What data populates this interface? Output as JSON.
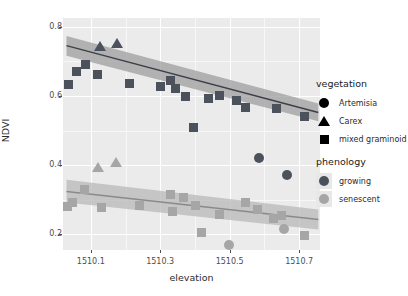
{
  "chart_data": {
    "type": "scatter",
    "title": "",
    "xlabel": "elevation",
    "ylabel": "NDVI",
    "xlim": [
      1510.02,
      1510.76
    ],
    "ylim": [
      0.155,
      0.825
    ],
    "xticks": [
      1510.1,
      1510.3,
      1510.5,
      1510.7
    ],
    "xticklabels": [
      "1510.1",
      "1510.3",
      "1510.5",
      "1510.7"
    ],
    "yticks": [
      0.2,
      0.4,
      0.6,
      0.8
    ],
    "yticklabels": [
      "0.2",
      "0.4",
      "0.6",
      "0.8"
    ],
    "grid": true,
    "panel_background": "#ebebeb",
    "legend_position": "right",
    "shape_variable": "vegetation",
    "color_variable": "phenology",
    "series": [
      {
        "name": "growing",
        "color": "#4c525c",
        "ribbon_color": "#9a9a9a",
        "fit_line": {
          "x0": 1510.03,
          "y0": 0.745,
          "x1": 1510.755,
          "y1": 0.552
        },
        "ribbon": {
          "x0": 1510.03,
          "upper0": 0.773,
          "lower0": 0.716,
          "x1": 1510.755,
          "upper1": 0.578,
          "lower1": 0.527
        },
        "points": [
          {
            "x": 1510.035,
            "y": 0.632,
            "vegetation": "mixed graminoid"
          },
          {
            "x": 1510.06,
            "y": 0.672,
            "vegetation": "mixed graminoid"
          },
          {
            "x": 1510.085,
            "y": 0.69,
            "vegetation": "mixed graminoid"
          },
          {
            "x": 1510.118,
            "y": 0.663,
            "vegetation": "mixed graminoid"
          },
          {
            "x": 1510.125,
            "y": 0.745,
            "vegetation": "Carex"
          },
          {
            "x": 1510.175,
            "y": 0.752,
            "vegetation": "Carex"
          },
          {
            "x": 1510.212,
            "y": 0.637,
            "vegetation": "mixed graminoid"
          },
          {
            "x": 1510.3,
            "y": 0.628,
            "vegetation": "mixed graminoid"
          },
          {
            "x": 1510.33,
            "y": 0.645,
            "vegetation": "mixed graminoid"
          },
          {
            "x": 1510.345,
            "y": 0.622,
            "vegetation": "mixed graminoid"
          },
          {
            "x": 1510.372,
            "y": 0.598,
            "vegetation": "mixed graminoid"
          },
          {
            "x": 1510.395,
            "y": 0.508,
            "vegetation": "mixed graminoid"
          },
          {
            "x": 1510.44,
            "y": 0.592,
            "vegetation": "mixed graminoid"
          },
          {
            "x": 1510.47,
            "y": 0.6,
            "vegetation": "mixed graminoid"
          },
          {
            "x": 1510.52,
            "y": 0.588,
            "vegetation": "mixed graminoid"
          },
          {
            "x": 1510.545,
            "y": 0.568,
            "vegetation": "mixed graminoid"
          },
          {
            "x": 1510.585,
            "y": 0.422,
            "vegetation": "Artemisia"
          },
          {
            "x": 1510.635,
            "y": 0.563,
            "vegetation": "mixed graminoid"
          },
          {
            "x": 1510.665,
            "y": 0.371,
            "vegetation": "Artemisia"
          },
          {
            "x": 1510.715,
            "y": 0.54,
            "vegetation": "mixed graminoid"
          }
        ]
      },
      {
        "name": "senescent",
        "color": "#a6a6a6",
        "ribbon_color": "#b5b5b5",
        "fit_line": {
          "x0": 1510.03,
          "y0": 0.324,
          "x1": 1510.755,
          "y1": 0.243
        },
        "ribbon": {
          "x0": 1510.03,
          "upper0": 0.358,
          "lower0": 0.292,
          "x1": 1510.755,
          "upper1": 0.272,
          "lower1": 0.214
        },
        "points": [
          {
            "x": 1510.033,
            "y": 0.281,
            "vegetation": "mixed graminoid"
          },
          {
            "x": 1510.047,
            "y": 0.292,
            "vegetation": "mixed graminoid"
          },
          {
            "x": 1510.082,
            "y": 0.331,
            "vegetation": "mixed graminoid"
          },
          {
            "x": 1510.12,
            "y": 0.394,
            "vegetation": "Carex"
          },
          {
            "x": 1510.13,
            "y": 0.277,
            "vegetation": "mixed graminoid"
          },
          {
            "x": 1510.172,
            "y": 0.41,
            "vegetation": "Carex"
          },
          {
            "x": 1510.24,
            "y": 0.283,
            "vegetation": "mixed graminoid"
          },
          {
            "x": 1510.328,
            "y": 0.316,
            "vegetation": "mixed graminoid"
          },
          {
            "x": 1510.335,
            "y": 0.266,
            "vegetation": "mixed graminoid"
          },
          {
            "x": 1510.368,
            "y": 0.308,
            "vegetation": "mixed graminoid"
          },
          {
            "x": 1510.4,
            "y": 0.283,
            "vegetation": "mixed graminoid"
          },
          {
            "x": 1510.42,
            "y": 0.206,
            "vegetation": "mixed graminoid"
          },
          {
            "x": 1510.47,
            "y": 0.259,
            "vegetation": "mixed graminoid"
          },
          {
            "x": 1510.498,
            "y": 0.17,
            "vegetation": "Artemisia"
          },
          {
            "x": 1510.545,
            "y": 0.293,
            "vegetation": "mixed graminoid"
          },
          {
            "x": 1510.58,
            "y": 0.272,
            "vegetation": "mixed graminoid"
          },
          {
            "x": 1510.625,
            "y": 0.246,
            "vegetation": "mixed graminoid"
          },
          {
            "x": 1510.65,
            "y": 0.256,
            "vegetation": "mixed graminoid"
          },
          {
            "x": 1510.655,
            "y": 0.215,
            "vegetation": "Artemisia"
          },
          {
            "x": 1510.715,
            "y": 0.196,
            "vegetation": "mixed graminoid"
          }
        ]
      }
    ]
  },
  "legends": {
    "vegetation": {
      "title": "vegetation",
      "items": [
        {
          "label": "Artemisia",
          "glyph": "circle"
        },
        {
          "label": "Carex",
          "glyph": "triangle"
        },
        {
          "label": "mixed graminoid",
          "glyph": "square"
        }
      ]
    },
    "phenology": {
      "title": "phenology",
      "items": [
        {
          "label": "growing",
          "glyph": "circle",
          "color": "#4c525c"
        },
        {
          "label": "senescent",
          "glyph": "circle",
          "color": "#a6a6a6"
        }
      ]
    }
  }
}
